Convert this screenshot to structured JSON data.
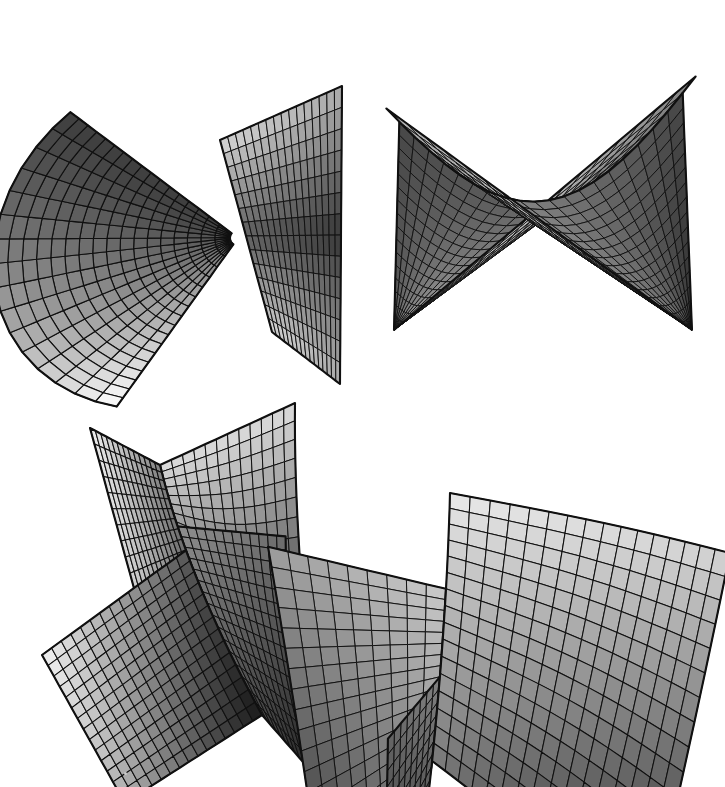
{
  "figure": {
    "background_color": "#ffffff",
    "width": 725,
    "height": 787,
    "caption": "",
    "line_color": "#101010",
    "shade_light": "#fafafa",
    "shade_dark": "#242424",
    "panel_labels": [
      "",
      "",
      "",
      ""
    ]
  },
  "chart_data": {
    "type": "surface",
    "xlabel": "",
    "ylabel": "",
    "grid": true,
    "legend": "none",
    "panels": [
      {
        "id": "top-left",
        "name": "cuspidal-edge-cone-surface",
        "description": "Fan-shaped sheet sweeping from upper right down to a pinch point, crossed by a second narrow ruled wedge forming an X",
        "mesh_u": 18,
        "mesh_v": 16,
        "shading": "gradient-light-upper-right-to-dark-left",
        "bbox": [
          30,
          35,
          345,
          390
        ]
      },
      {
        "id": "top-right",
        "name": "hyperbolic-saddle-ruled-surface",
        "description": "Two ruled sheets crossing in an X beneath a concave catenary-like upper boundary curve",
        "mesh_u": 20,
        "mesh_v": 18,
        "shading": "gradient-dark-upper-left-to-light-lower-left",
        "bbox": [
          375,
          60,
          710,
          360
        ]
      },
      {
        "id": "bottom-left",
        "name": "folded-developable-surface-left",
        "description": "Vertical panel creased along a V fold joining a broad flared lower sheet",
        "mesh_u": 16,
        "mesh_v": 18,
        "shading": "gradient-light-upper-left-to-dark-lower-right",
        "bbox": [
          40,
          425,
          345,
          730
        ]
      },
      {
        "id": "bottom-right",
        "name": "folded-developable-surface-right",
        "description": "Tilted broad sheet creased along a diagonal ridge with a narrow folded flap on the left",
        "mesh_u": 16,
        "mesh_v": 18,
        "shading": "gradient-light-upper-left-to-dark-lower-right",
        "bbox": [
          400,
          420,
          710,
          740
        ]
      }
    ]
  },
  "artifacts": [
    {
      "name": "dust-speck",
      "x": 124,
      "y": 772
    }
  ]
}
